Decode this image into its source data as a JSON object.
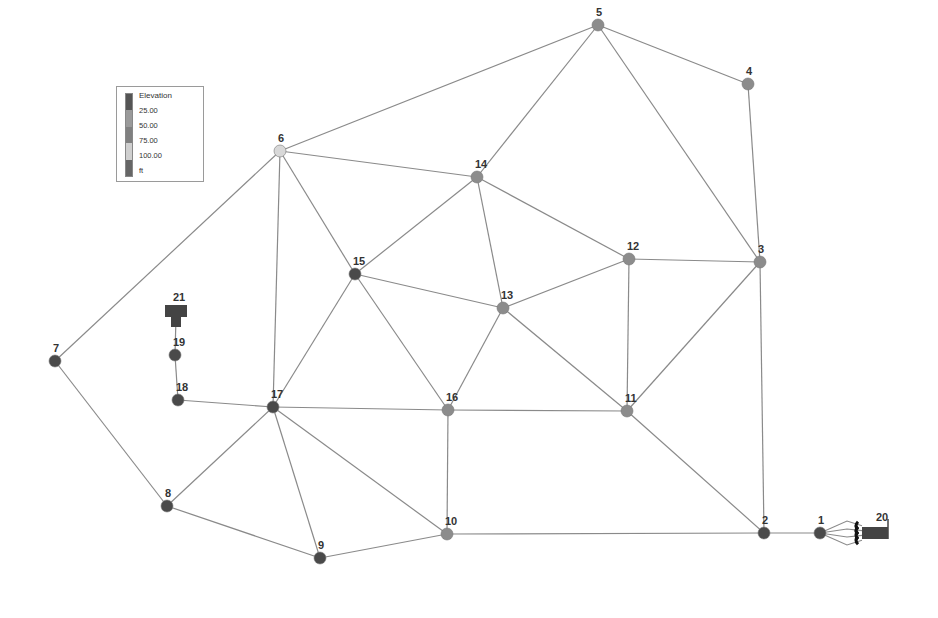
{
  "legend": {
    "title": "Elevation",
    "labels": [
      "25.00",
      "50.00",
      "75.00",
      "100.00"
    ],
    "unit": "ft",
    "colors": [
      "#555555",
      "#9a9a9a",
      "#808080",
      "#cfcfcf",
      "#666666"
    ]
  },
  "colors": {
    "pipe": "#8a8a8a",
    "node_dark": "#4a4a4a",
    "node_mid": "#8c8c8c",
    "node_light": "#d8d8d8",
    "tank": "#444444",
    "label": "#333333"
  },
  "nodes": [
    {
      "id": "1",
      "x": 820,
      "y": 533,
      "shade": "dark"
    },
    {
      "id": "2",
      "x": 764,
      "y": 533,
      "shade": "dark"
    },
    {
      "id": "3",
      "x": 760,
      "y": 262,
      "shade": "mid"
    },
    {
      "id": "4",
      "x": 748,
      "y": 84,
      "shade": "mid"
    },
    {
      "id": "5",
      "x": 598,
      "y": 25,
      "shade": "mid"
    },
    {
      "id": "6",
      "x": 280,
      "y": 151,
      "shade": "light"
    },
    {
      "id": "7",
      "x": 55,
      "y": 361,
      "shade": "dark"
    },
    {
      "id": "8",
      "x": 167,
      "y": 506,
      "shade": "dark"
    },
    {
      "id": "9",
      "x": 320,
      "y": 558,
      "shade": "dark"
    },
    {
      "id": "10",
      "x": 447,
      "y": 534,
      "shade": "mid"
    },
    {
      "id": "11",
      "x": 627,
      "y": 411,
      "shade": "mid"
    },
    {
      "id": "12",
      "x": 629,
      "y": 259,
      "shade": "mid"
    },
    {
      "id": "13",
      "x": 503,
      "y": 308,
      "shade": "mid"
    },
    {
      "id": "14",
      "x": 477,
      "y": 177,
      "shade": "mid"
    },
    {
      "id": "15",
      "x": 355,
      "y": 274,
      "shade": "dark"
    },
    {
      "id": "16",
      "x": 448,
      "y": 410,
      "shade": "mid"
    },
    {
      "id": "17",
      "x": 273,
      "y": 407,
      "shade": "dark"
    },
    {
      "id": "18",
      "x": 178,
      "y": 400,
      "shade": "dark"
    },
    {
      "id": "19",
      "x": 175,
      "y": 355,
      "shade": "dark"
    }
  ],
  "reservoirs": [
    {
      "id": "20",
      "x": 876,
      "y": 533
    },
    {
      "id": "21",
      "x": 176,
      "y": 317
    }
  ],
  "pipes": [
    [
      "5",
      "4"
    ],
    [
      "5",
      "6"
    ],
    [
      "5",
      "14"
    ],
    [
      "5",
      "3"
    ],
    [
      "4",
      "3"
    ],
    [
      "6",
      "14"
    ],
    [
      "6",
      "15"
    ],
    [
      "6",
      "17"
    ],
    [
      "6",
      "7"
    ],
    [
      "14",
      "15"
    ],
    [
      "14",
      "13"
    ],
    [
      "14",
      "12"
    ],
    [
      "15",
      "13"
    ],
    [
      "15",
      "17"
    ],
    [
      "15",
      "16"
    ],
    [
      "13",
      "12"
    ],
    [
      "13",
      "16"
    ],
    [
      "13",
      "11"
    ],
    [
      "12",
      "3"
    ],
    [
      "12",
      "11"
    ],
    [
      "3",
      "11"
    ],
    [
      "3",
      "2"
    ],
    [
      "11",
      "2"
    ],
    [
      "16",
      "11"
    ],
    [
      "16",
      "10"
    ],
    [
      "17",
      "16"
    ],
    [
      "17",
      "8"
    ],
    [
      "17",
      "9"
    ],
    [
      "17",
      "10"
    ],
    [
      "17",
      "18"
    ],
    [
      "18",
      "19"
    ],
    [
      "19",
      "21"
    ],
    [
      "7",
      "8"
    ],
    [
      "8",
      "9"
    ],
    [
      "9",
      "10"
    ],
    [
      "10",
      "2"
    ],
    [
      "2",
      "1"
    ]
  ],
  "pump_links": [
    {
      "from": "1",
      "to": "20",
      "count": 4
    }
  ]
}
